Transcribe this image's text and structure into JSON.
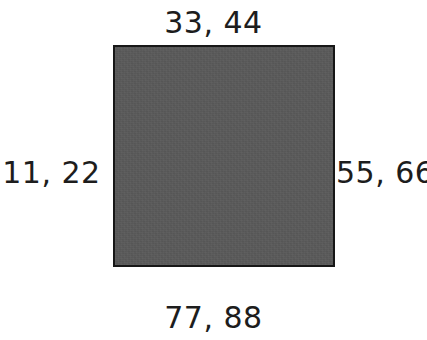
{
  "canvas": {
    "width": 427,
    "height": 340,
    "background_color": "#ffffff"
  },
  "figure": {
    "type": "labeled-square-diagram",
    "shape": {
      "name": "square",
      "fill_color": "#5a5a5a",
      "stroke_color": "#171717",
      "stroke_width": 2,
      "x": 113,
      "y": 45,
      "width": 222,
      "height": 222
    },
    "text_color": "#1d1d1d",
    "labels": {
      "top": "33, 44",
      "left": "11, 22",
      "right": "55, 66",
      "bottom": "77, 88"
    }
  }
}
